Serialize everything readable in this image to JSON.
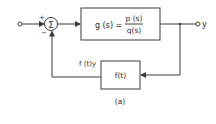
{
  "diagram": {
    "type": "feedback-block-diagram",
    "caption": "(a)",
    "summing_junction": {
      "symbol": "Σ",
      "plus_sign": "+",
      "minus_sign": "−"
    },
    "forward_block": {
      "lhs": "g (s) =",
      "numerator": "p (s)",
      "denominator": "q(s)"
    },
    "feedback_block": {
      "label": "f(t)"
    },
    "feedback_signal_label": "f (t)y",
    "output_label": "y",
    "colors": {
      "line": "#3a3a3a",
      "text": "#2a2a2a",
      "background": "#ffffff"
    }
  }
}
